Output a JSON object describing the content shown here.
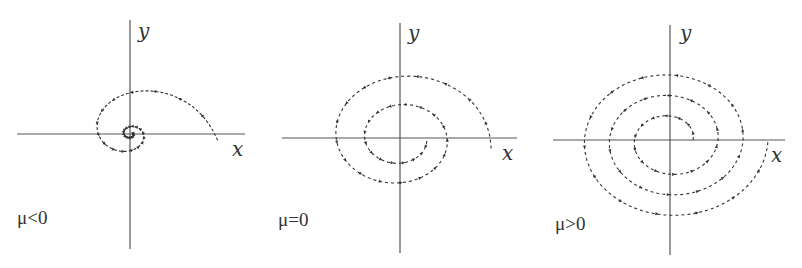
{
  "figure": {
    "axis_color": "#555555",
    "curve_color": "#333333",
    "panels": [
      {
        "id": "mu-negative",
        "condition": "μ<0",
        "condition_parts": {
          "symbol": "μ",
          "relation": "<",
          "value": "0"
        },
        "x_label": "x",
        "y_label": "y",
        "behavior": "stable focus (spiral inward)",
        "center": [
          130,
          134
        ],
        "x_axis": [
          17,
          245
        ],
        "y_axis": [
          20,
          249
        ],
        "label_pos": [
          17,
          224
        ],
        "x_label_pos": [
          232,
          156
        ],
        "y_label_pos": [
          138,
          38
        ],
        "spiral": {
          "r_start": 88,
          "r_end": 2,
          "turns": 2.2,
          "start_angle_deg": -5,
          "growth": "inward"
        }
      },
      {
        "id": "mu-zero",
        "condition": "μ=0",
        "condition_parts": {
          "symbol": "μ",
          "relation": "=",
          "value": "0"
        },
        "x_label": "x",
        "y_label": "y",
        "behavior": "trajectory approaching a limit cycle / center",
        "center": [
          400,
          138
        ],
        "x_axis": [
          282,
          517
        ],
        "y_axis": [
          23,
          253
        ],
        "label_pos": [
          278,
          226
        ],
        "x_label_pos": [
          502,
          160
        ],
        "y_label_pos": [
          408,
          40
        ],
        "spiral": {
          "r_start": 92,
          "r_end": 27,
          "turns": 2.0,
          "start_angle_deg": -8,
          "growth": "inward"
        }
      },
      {
        "id": "mu-positive",
        "condition": "μ>0",
        "condition_parts": {
          "symbol": "μ",
          "relation": ">",
          "value": "0"
        },
        "x_label": "x",
        "y_label": "y",
        "behavior": "unstable focus (spiral outward)",
        "center": [
          670,
          140
        ],
        "x_axis": [
          553,
          785
        ],
        "y_axis": [
          25,
          255
        ],
        "label_pos": [
          555,
          230
        ],
        "x_label_pos": [
          771,
          162
        ],
        "y_label_pos": [
          680,
          40
        ],
        "spiral": {
          "r_start": 23,
          "r_end": 98,
          "turns": 3.0,
          "start_angle_deg": 0,
          "growth": "outward"
        }
      }
    ]
  }
}
